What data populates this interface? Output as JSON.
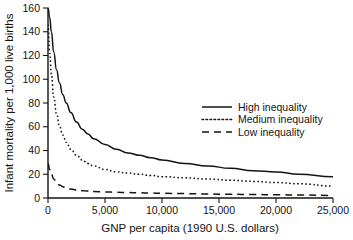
{
  "chart_data": {
    "type": "line",
    "title": "",
    "xlabel": "GNP per capita (1990 U.S. dollars)",
    "ylabel": "Infant mortality per 1,000 live births",
    "xlim": [
      0,
      25000
    ],
    "ylim": [
      0,
      160
    ],
    "xticks": [
      0,
      5000,
      10000,
      15000,
      20000,
      25000
    ],
    "xticklabels": [
      "0",
      "5,000",
      "10,000",
      "15,000",
      "20,000",
      "25,000"
    ],
    "yticks": [
      0,
      20,
      40,
      60,
      80,
      100,
      120,
      140,
      160
    ],
    "yticklabels": [
      "0",
      "20",
      "40",
      "60",
      "80",
      "100",
      "120",
      "140",
      "160"
    ],
    "grid": false,
    "legend_position": "center-right",
    "line_color": "#141414",
    "background_color": "#ffffff",
    "series": [
      {
        "name": "High inequality",
        "style": "solid",
        "dash": "none",
        "x": [
          0,
          150,
          300,
          500,
          750,
          1000,
          1300,
          1600,
          2000,
          2500,
          3000,
          3500,
          4000,
          5000,
          6000,
          7000,
          8000,
          9000,
          10000,
          12000,
          14000,
          16000,
          18000,
          20000,
          22000,
          25000
        ],
        "y": [
          160,
          152,
          140,
          123,
          108,
          97,
          87,
          80,
          72,
          64,
          58,
          54,
          50,
          45,
          41,
          38,
          36,
          34,
          32,
          29,
          27,
          25,
          23,
          22,
          20,
          18
        ]
      },
      {
        "name": "Medium inequality",
        "style": "dotted",
        "dash": "1.6 2.4",
        "x": [
          0,
          150,
          300,
          500,
          750,
          1000,
          1300,
          1600,
          2000,
          2500,
          3000,
          3500,
          4000,
          5000,
          6000,
          7000,
          8000,
          9000,
          10000,
          12000,
          14000,
          16000,
          18000,
          20000,
          22000,
          25000
        ],
        "y": [
          146,
          122,
          104,
          85,
          71,
          61,
          53,
          47,
          41,
          36,
          32,
          29,
          27,
          24,
          22,
          21,
          20,
          19,
          18,
          17,
          16,
          15,
          14,
          13,
          12,
          10
        ]
      },
      {
        "name": "Low inequality",
        "style": "dashed",
        "dash": "7 5",
        "x": [
          0,
          150,
          300,
          500,
          750,
          1000,
          1300,
          1600,
          2000,
          2500,
          3000,
          3500,
          4000,
          5000,
          6000,
          7000,
          8000,
          9000,
          10000,
          12000,
          14000,
          16000,
          18000,
          20000,
          22000,
          25000
        ],
        "y": [
          29,
          24,
          20,
          16,
          13,
          11,
          9.5,
          8.5,
          7.6,
          6.8,
          6.2,
          5.8,
          5.5,
          5.1,
          4.8,
          4.6,
          4.4,
          4.2,
          4.0,
          3.7,
          3.4,
          3.1,
          2.9,
          2.7,
          2.5,
          2.2
        ]
      }
    ]
  },
  "legend": {
    "items": [
      {
        "label": "High inequality",
        "style": "solid"
      },
      {
        "label": "Medium inequality",
        "style": "dotted"
      },
      {
        "label": "Low inequality",
        "style": "dashed"
      }
    ]
  }
}
